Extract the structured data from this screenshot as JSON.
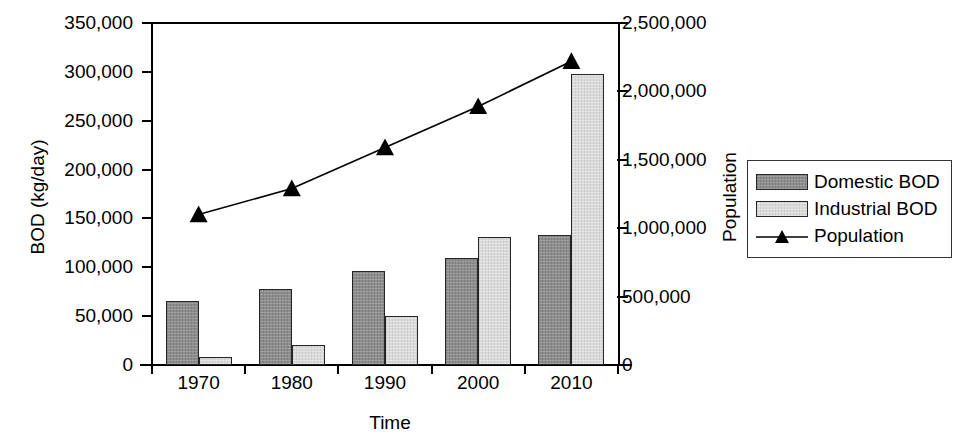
{
  "chart_data": {
    "type": "bar",
    "title": "",
    "xlabel": "Time",
    "ylabel": "BOD (kg/day)",
    "y2label": "Population",
    "categories": [
      "1970",
      "1980",
      "1990",
      "2000",
      "2010"
    ],
    "ylim": [
      0,
      350000
    ],
    "yticks": [
      "0",
      "50,000",
      "100,000",
      "150,000",
      "200,000",
      "250,000",
      "300,000",
      "350,000"
    ],
    "ytick_values": [
      0,
      50000,
      100000,
      150000,
      200000,
      250000,
      300000,
      350000
    ],
    "y2lim": [
      0,
      2500000
    ],
    "y2ticks": [
      "0",
      "500,000",
      "1,000,000",
      "1,500,000",
      "2,000,000",
      "2,500,000"
    ],
    "y2tick_values": [
      0,
      500000,
      1000000,
      1500000,
      2000000,
      2500000
    ],
    "grid": false,
    "legend_position": "right",
    "series": [
      {
        "name": "Domestic BOD",
        "kind": "bar",
        "axis": "left",
        "color": "#8c8c8c",
        "values": [
          66000,
          78000,
          96000,
          110000,
          133000
        ]
      },
      {
        "name": "Industrial BOD",
        "kind": "bar",
        "axis": "left",
        "color": "#d9d9d9",
        "values": [
          8000,
          20000,
          50000,
          131000,
          298000
        ]
      },
      {
        "name": "Population",
        "kind": "line",
        "axis": "right",
        "color": "#000000",
        "marker": "triangle",
        "values": [
          1100000,
          1290000,
          1590000,
          1890000,
          2220000
        ]
      }
    ]
  },
  "legend": {
    "items": [
      {
        "label": "Domestic BOD",
        "swatch": "domestic"
      },
      {
        "label": "Industrial BOD",
        "swatch": "industrial"
      },
      {
        "label": "Population",
        "swatch": "line-triangle"
      }
    ]
  }
}
